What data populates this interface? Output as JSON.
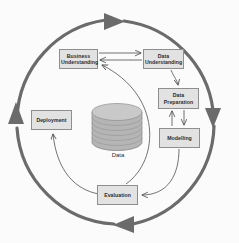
{
  "diagram": {
    "background_color": "#fbfbfb",
    "box_fill_color": "#e2e2e2",
    "box_border_color": "#8e8e8e",
    "outer_arrow_color": "#6b6b6b",
    "inner_arrow_color": "#6b6b6b",
    "cylinder_color": "#b3b3b3",
    "nodes": [
      {
        "id": "business-understanding",
        "label": "Business\nUnderstanding",
        "x": 59,
        "y": 49,
        "w": 39,
        "h": 20
      },
      {
        "id": "data-understanding",
        "label": "Data\nUnderstanding",
        "x": 143,
        "y": 49,
        "w": 41,
        "h": 20
      },
      {
        "id": "data-preparation",
        "label": "Data\nPreparation",
        "x": 158,
        "y": 88,
        "w": 41,
        "h": 21
      },
      {
        "id": "modelling",
        "label": "Modelling",
        "x": 159,
        "y": 128,
        "w": 41,
        "h": 20
      },
      {
        "id": "deployment",
        "label": "Deployment",
        "x": 31,
        "y": 110,
        "w": 41,
        "h": 20
      },
      {
        "id": "evaluation",
        "label": "Evaluation",
        "x": 97,
        "y": 185,
        "w": 41,
        "h": 20
      }
    ],
    "data_store": {
      "id": "data-cylinder",
      "label": "Data",
      "cx": 117,
      "cy": 128
    },
    "outer_cycle": {
      "cx": 119,
      "cy": 122,
      "radius": 103,
      "arrowheads": [
        {
          "id": "outer-arrow-top",
          "direction": "right",
          "x": 113,
          "y": 21
        },
        {
          "id": "outer-arrow-right",
          "direction": "down",
          "x": 213,
          "y": 117
        },
        {
          "id": "outer-arrow-bottom",
          "direction": "left",
          "x": 123,
          "y": 227
        },
        {
          "id": "outer-arrow-left",
          "direction": "up",
          "x": 16,
          "y": 113
        }
      ]
    },
    "connections": [
      {
        "id": "conn-bu-to-du",
        "from": "business-understanding",
        "to": "data-understanding"
      },
      {
        "id": "conn-du-to-bu",
        "from": "data-understanding",
        "to": "business-understanding"
      },
      {
        "id": "conn-du-to-dp",
        "from": "data-understanding",
        "to": "data-preparation"
      },
      {
        "id": "conn-dp-to-mod",
        "from": "data-preparation",
        "to": "modelling"
      },
      {
        "id": "conn-mod-to-dp",
        "from": "modelling",
        "to": "data-preparation"
      },
      {
        "id": "conn-mod-to-eval",
        "from": "modelling",
        "to": "evaluation"
      },
      {
        "id": "conn-eval-to-bu",
        "from": "evaluation",
        "to": "business-understanding"
      },
      {
        "id": "conn-eval-to-deploy",
        "from": "evaluation",
        "to": "deployment"
      }
    ]
  }
}
